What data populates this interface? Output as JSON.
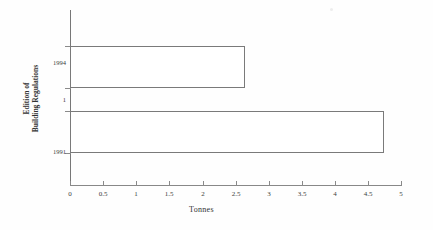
{
  "chart_data": {
    "type": "bar",
    "orientation": "horizontal",
    "title": "",
    "categories": [
      "1991",
      "1994"
    ],
    "values": [
      4.75,
      2.65
    ],
    "series": [
      {
        "name": "Tonnes",
        "values": [
          4.75,
          2.65
        ]
      }
    ],
    "xlabel": "Tonnes",
    "ylabel": "Edition of Building Regulations",
    "ylabel_lines": [
      "Edition of",
      "Building Regulations"
    ],
    "xlim": [
      0,
      5
    ],
    "xticks": [
      "0",
      "0.5",
      "1",
      "1.5",
      "2",
      "2.5",
      "3",
      "3.5",
      "4",
      "4.5",
      "5"
    ],
    "xtick_values": [
      0,
      0.5,
      1,
      1.5,
      2,
      2.5,
      3,
      3.5,
      4,
      4.5,
      5
    ],
    "ytick_labels": [
      "1994",
      "1",
      "1991"
    ],
    "grid": false,
    "legend": false,
    "bar_fill_color": "#ffffff",
    "bar_edge_color": "#7a7a7a",
    "axis_color": "#888888",
    "text_color": "#3c3c3c"
  },
  "bars": [
    {
      "label": "1994",
      "value": 2.65,
      "name": "bar-1994"
    },
    {
      "label": "1991",
      "value": 4.75,
      "name": "bar-1991"
    }
  ],
  "axes": {
    "x_title": "Tonnes",
    "y_title_line1": "Edition of",
    "y_title_line2": "Building Regulations"
  },
  "ytick": {
    "top": "1994",
    "middle": "1",
    "bottom": "1991"
  }
}
